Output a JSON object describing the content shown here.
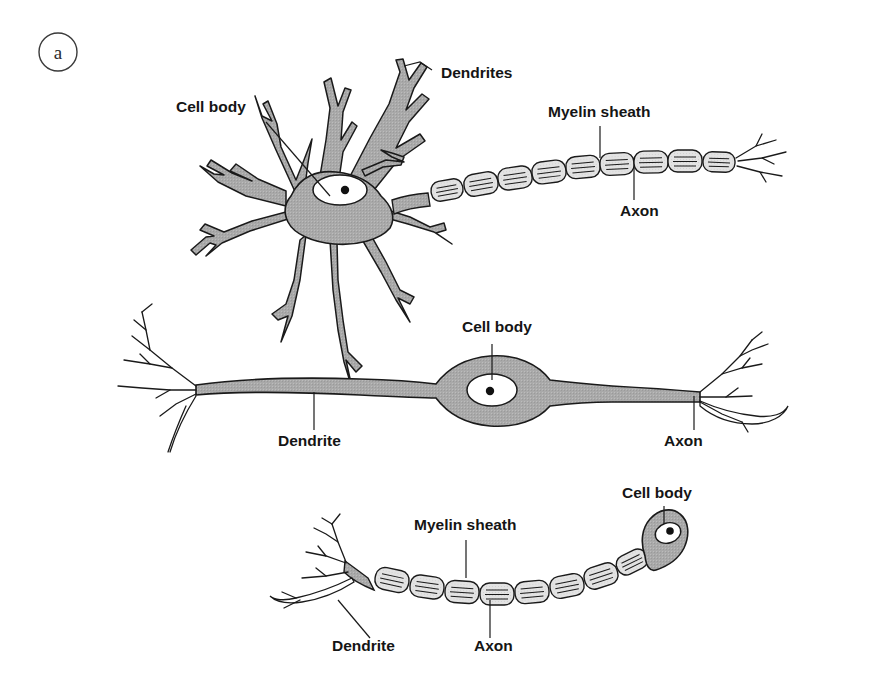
{
  "figure": {
    "panel_letter": "a",
    "background_color": "#ffffff",
    "cell_fill_color": "#a8a8a8",
    "myelin_fill_color": "#e2e2e2",
    "outline_color": "#1a1a1a",
    "label_color": "#151515"
  },
  "diagram_data": {
    "type": "diagram",
    "subject": "Neuron structural types",
    "panel": "a",
    "neurons": [
      {
        "id": "multipolar",
        "labels": [
          {
            "text": "Dendrites",
            "x": 441,
            "y": 78
          },
          {
            "text": "Cell body",
            "x": 176,
            "y": 112
          },
          {
            "text": "Myelin sheath",
            "x": 548,
            "y": 117
          },
          {
            "text": "Axon",
            "x": 620,
            "y": 216
          }
        ],
        "myelin_segment_count": 10
      },
      {
        "id": "bipolar",
        "labels": [
          {
            "text": "Cell body",
            "x": 462,
            "y": 332
          },
          {
            "text": "Dendrite",
            "x": 278,
            "y": 446
          },
          {
            "text": "Axon",
            "x": 664,
            "y": 446
          }
        ],
        "myelin_segment_count": 0
      },
      {
        "id": "unipolar",
        "labels": [
          {
            "text": "Cell body",
            "x": 622,
            "y": 498
          },
          {
            "text": "Myelin sheath",
            "x": 414,
            "y": 530
          },
          {
            "text": "Axon",
            "x": 474,
            "y": 651
          },
          {
            "text": "Dendrite",
            "x": 332,
            "y": 651
          }
        ],
        "myelin_segment_count": 8
      }
    ],
    "label_texts": [
      "Dendrites",
      "Cell body",
      "Myelin sheath",
      "Axon",
      "Dendrite"
    ]
  }
}
